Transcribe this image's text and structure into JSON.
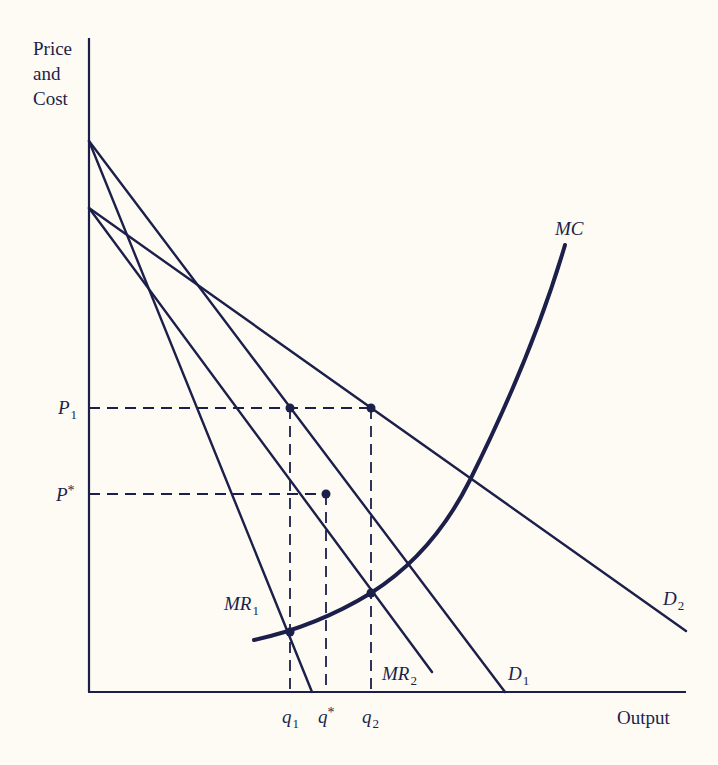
{
  "axes": {
    "y_label_lines": [
      "Price",
      "and",
      "Cost"
    ],
    "x_label": "Output"
  },
  "price_labels": {
    "p1": {
      "base": "P",
      "sub": "1"
    },
    "pstar": {
      "base": "P",
      "sup": "*"
    }
  },
  "quantity_labels": {
    "q1": {
      "base": "q",
      "sub": "1"
    },
    "qstar": {
      "base": "q",
      "sup": "*"
    },
    "q2": {
      "base": "q",
      "sub": "2"
    }
  },
  "curve_labels": {
    "mc": "MC",
    "mr1": {
      "base": "MR",
      "sub": "1"
    },
    "mr2": {
      "base": "MR",
      "sub": "2"
    },
    "d1": {
      "base": "D",
      "sub": "1"
    },
    "d2": {
      "base": "D",
      "sub": "2"
    }
  },
  "colors": {
    "ink": "#1b1f4a",
    "background": "#fdfbf3"
  },
  "diagram": {
    "type": "economics-monopoly-price-discrimination",
    "curves": [
      "D1",
      "MR1",
      "D2",
      "MR2",
      "MC"
    ],
    "marked_points": [
      {
        "name": "P1-q1 on D1",
        "x": 290,
        "y": 408
      },
      {
        "name": "P1-q2 on D2",
        "x": 371,
        "y": 408
      },
      {
        "name": "P*-q*",
        "x": 326,
        "y": 494
      },
      {
        "name": "MR1 = MC",
        "x": 290,
        "y": 632
      },
      {
        "name": "MR2 = MC",
        "x": 371,
        "y": 593
      }
    ]
  }
}
